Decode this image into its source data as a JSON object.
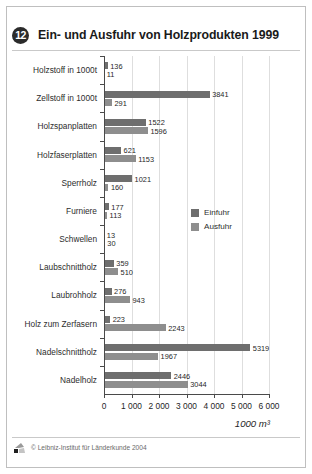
{
  "header": {
    "badge": "12",
    "title": "Ein- und Ausfuhr von Holzprodukten 1999"
  },
  "legend": {
    "items": [
      {
        "label": "Einfuhr",
        "color": "#6e6e6e"
      },
      {
        "label": "Ausfuhr",
        "color": "#8e8e8e"
      }
    ]
  },
  "footer": {
    "copyright": "© Leibniz-Institut für Länderkunde 2004"
  },
  "chart_data": {
    "type": "bar",
    "orientation": "horizontal",
    "title": "Ein- und Ausfuhr von Holzprodukten 1999",
    "xlabel": "1000 m³",
    "ylabel": "",
    "xlim": [
      0,
      6000
    ],
    "xticks": [
      0,
      1000,
      2000,
      3000,
      4000,
      5000,
      6000
    ],
    "xtick_labels": [
      "0",
      "1 000",
      "2 000",
      "3 000",
      "4 000",
      "5 000",
      "6 000"
    ],
    "grid": true,
    "legend_position": "center-right",
    "categories": [
      "Holzstoff in 1000t",
      "Zellstoff in 1000t",
      "Holzspanplatten",
      "Holzfaserplatten",
      "Sperrholz",
      "Furniere",
      "Schwellen",
      "Laubschnittholz",
      "Laubrohholz",
      "Holz zum Zerfasern",
      "Nadelschnittholz",
      "Nadelholz"
    ],
    "series": [
      {
        "name": "Einfuhr",
        "color": "#6e6e6e",
        "values": [
          136,
          3841,
          1522,
          621,
          1021,
          177,
          13,
          359,
          276,
          223,
          5319,
          2446
        ]
      },
      {
        "name": "Ausfuhr",
        "color": "#8e8e8e",
        "values": [
          11,
          291,
          1596,
          1153,
          160,
          113,
          30,
          510,
          943,
          2243,
          1967,
          3044
        ]
      }
    ]
  }
}
